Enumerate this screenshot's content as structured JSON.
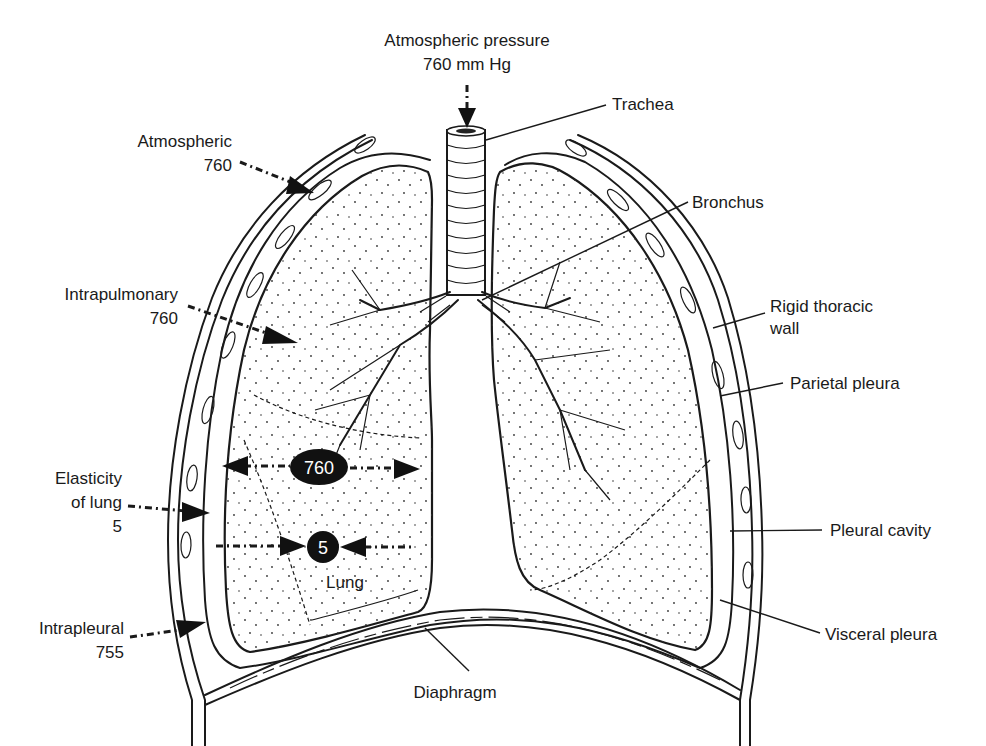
{
  "figure": {
    "labels": {
      "atm_pressure_title": "Atmospheric pressure",
      "atm_pressure_value": "760 mm Hg",
      "trachea": "Trachea",
      "bronchus": "Bronchus",
      "rigid_wall_line1": "Rigid thoracic",
      "rigid_wall_line2": "wall",
      "parietal_pleura": "Parietal pleura",
      "pleural_cavity": "Pleural cavity",
      "visceral_pleura": "Visceral pleura",
      "diaphragm": "Diaphragm",
      "lung": "Lung",
      "atmospheric_line1": "Atmospheric",
      "atmospheric_line2": "760",
      "intrapulmonary_line1": "Intrapulmonary",
      "intrapulmonary_line2": "760",
      "elasticity_line1": "Elasticity",
      "elasticity_line2": "of lung",
      "elasticity_line3": "5",
      "intrapleural_line1": "Intrapleural",
      "intrapleural_line2": "755"
    },
    "badges": {
      "outward_pressure": "760",
      "recoil_pressure": "5"
    },
    "colors": {
      "ink": "#1a1a1a",
      "background": "#ffffff",
      "badge": "#111111"
    }
  }
}
